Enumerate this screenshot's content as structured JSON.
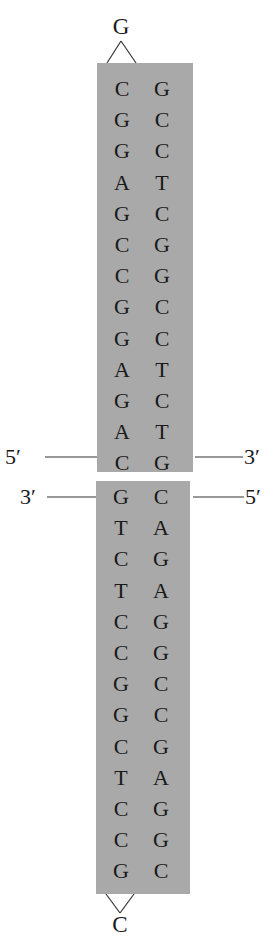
{
  "diagram": {
    "type": "DNA hairpin / cruciform palindrome",
    "colors": {
      "box_fill": "#a9a9a9",
      "text": "#1a1a1a",
      "background": "#ffffff"
    },
    "top_hairpin": {
      "loop_base": "G",
      "pairs": [
        [
          "C",
          "G"
        ],
        [
          "G",
          "C"
        ],
        [
          "G",
          "C"
        ],
        [
          "A",
          "T"
        ],
        [
          "G",
          "C"
        ],
        [
          "C",
          "G"
        ],
        [
          "C",
          "G"
        ],
        [
          "G",
          "C"
        ],
        [
          "G",
          "C"
        ],
        [
          "A",
          "T"
        ],
        [
          "G",
          "C"
        ],
        [
          "A",
          "T"
        ],
        [
          "C",
          "G"
        ]
      ],
      "left_end_label": "5′",
      "right_end_label": "3′"
    },
    "bottom_hairpin": {
      "loop_base": "C",
      "pairs": [
        [
          "G",
          "C"
        ],
        [
          "T",
          "A"
        ],
        [
          "C",
          "G"
        ],
        [
          "T",
          "A"
        ],
        [
          "C",
          "G"
        ],
        [
          "C",
          "G"
        ],
        [
          "G",
          "C"
        ],
        [
          "G",
          "C"
        ],
        [
          "C",
          "G"
        ],
        [
          "T",
          "A"
        ],
        [
          "C",
          "G"
        ],
        [
          "C",
          "G"
        ],
        [
          "G",
          "C"
        ]
      ],
      "left_end_label": "3′",
      "right_end_label": "5′"
    }
  }
}
